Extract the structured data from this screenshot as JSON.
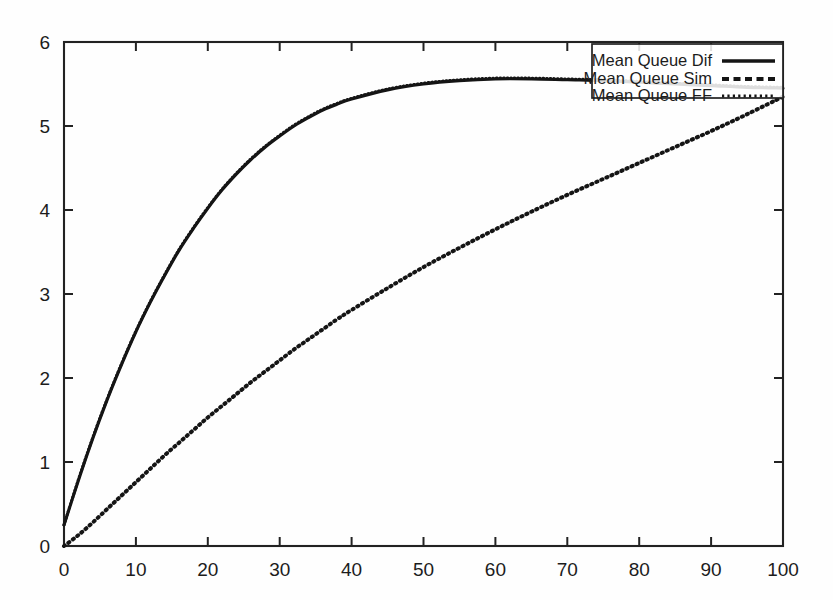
{
  "chart_data": {
    "type": "line",
    "title": "",
    "xlabel": "",
    "ylabel": "",
    "xlim": [
      0,
      100
    ],
    "ylim": [
      0,
      6
    ],
    "grid": false,
    "legend_position": "top-right",
    "xticks": [
      0,
      10,
      20,
      30,
      40,
      50,
      60,
      70,
      80,
      90,
      100
    ],
    "yticks": [
      0,
      1,
      2,
      3,
      4,
      5,
      6
    ],
    "xtick_labels": [
      "0",
      "10",
      "20",
      "30",
      "40",
      "50",
      "60",
      "70",
      "80",
      "90",
      "100"
    ],
    "ytick_labels": [
      "0",
      "1",
      "2",
      "3",
      "4",
      "5",
      "6"
    ],
    "x": [
      0,
      2,
      4,
      6,
      8,
      10,
      12,
      14,
      16,
      18,
      20,
      22,
      24,
      26,
      28,
      30,
      32,
      34,
      36,
      38,
      40,
      45,
      50,
      55,
      60,
      65,
      70,
      75,
      80,
      85,
      90,
      95,
      100
    ],
    "series": [
      {
        "name": "Mean Queue Dif",
        "style": "solid",
        "values": [
          0.25,
          0.78,
          1.28,
          1.74,
          2.16,
          2.55,
          2.9,
          3.22,
          3.52,
          3.78,
          4.02,
          4.24,
          4.43,
          4.6,
          4.75,
          4.88,
          5.0,
          5.1,
          5.19,
          5.26,
          5.32,
          5.43,
          5.5,
          5.54,
          5.56,
          5.56,
          5.55,
          5.54,
          5.52,
          5.5,
          5.48,
          5.46,
          5.45
        ]
      },
      {
        "name": "Mean Queue FF",
        "style": "dotted-fine",
        "values": [
          0.25,
          0.79,
          1.29,
          1.75,
          2.17,
          2.56,
          2.91,
          3.23,
          3.53,
          3.79,
          4.03,
          4.25,
          4.44,
          4.61,
          4.76,
          4.89,
          5.01,
          5.11,
          5.2,
          5.27,
          5.33,
          5.44,
          5.51,
          5.55,
          5.57,
          5.57,
          5.56,
          5.55,
          5.53,
          5.51,
          5.49,
          5.47,
          5.46
        ]
      },
      {
        "name": "Mean Queue Sim",
        "style": "dotted-coarse",
        "values": [
          0.0,
          0.13,
          0.28,
          0.44,
          0.6,
          0.76,
          0.92,
          1.08,
          1.23,
          1.38,
          1.53,
          1.67,
          1.81,
          1.95,
          2.08,
          2.21,
          2.34,
          2.46,
          2.58,
          2.7,
          2.81,
          3.07,
          3.32,
          3.55,
          3.77,
          3.98,
          4.18,
          4.37,
          4.56,
          4.75,
          4.94,
          5.14,
          5.35
        ]
      }
    ],
    "legend_entries": [
      {
        "label": "Mean Queue Dif",
        "style": "solid"
      },
      {
        "label": "Mean Queue Sim",
        "style": "dash"
      },
      {
        "label": "Mean Queue FF",
        "style": "dot"
      }
    ]
  },
  "colors": {
    "ink": "#151515",
    "frame": "#222222",
    "background": "#fefefe"
  }
}
